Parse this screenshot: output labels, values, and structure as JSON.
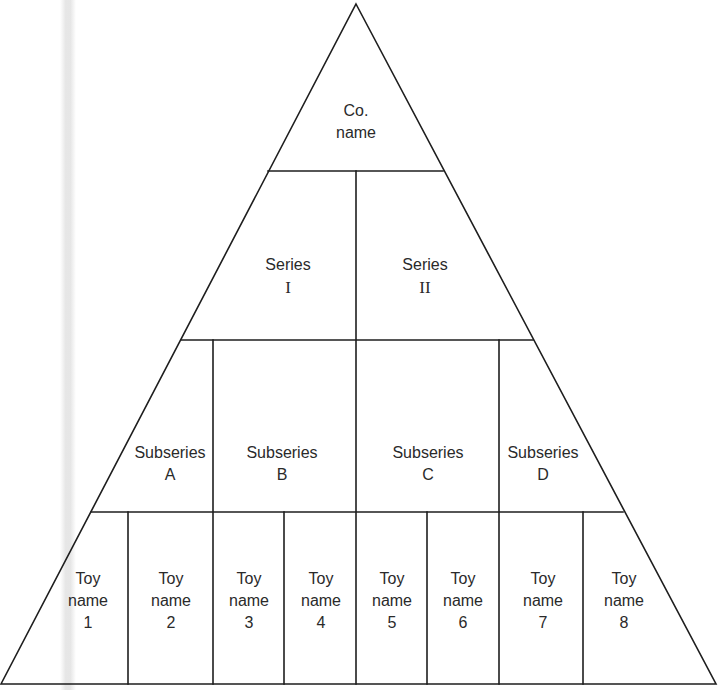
{
  "diagram": {
    "type": "hierarchy-pyramid",
    "levels": [
      {
        "name": "company",
        "nodes": [
          {
            "line1": "Co.",
            "line2": "name"
          }
        ]
      },
      {
        "name": "series",
        "nodes": [
          {
            "line1": "Series",
            "line2": "I"
          },
          {
            "line1": "Series",
            "line2": "II"
          }
        ]
      },
      {
        "name": "subseries",
        "nodes": [
          {
            "line1": "Subseries",
            "line2": "A"
          },
          {
            "line1": "Subseries",
            "line2": "B"
          },
          {
            "line1": "Subseries",
            "line2": "C"
          },
          {
            "line1": "Subseries",
            "line2": "D"
          }
        ]
      },
      {
        "name": "toys",
        "nodes": [
          {
            "line1": "Toy",
            "line2": "name",
            "line3": "1"
          },
          {
            "line1": "Toy",
            "line2": "name",
            "line3": "2"
          },
          {
            "line1": "Toy",
            "line2": "name",
            "line3": "3"
          },
          {
            "line1": "Toy",
            "line2": "name",
            "line3": "4"
          },
          {
            "line1": "Toy",
            "line2": "name",
            "line3": "5"
          },
          {
            "line1": "Toy",
            "line2": "name",
            "line3": "6"
          },
          {
            "line1": "Toy",
            "line2": "name",
            "line3": "7"
          },
          {
            "line1": "Toy",
            "line2": "name",
            "line3": "8"
          }
        ]
      }
    ],
    "colors": {
      "line": "#1e1e1e",
      "text": "#2a2a2a",
      "background": "#ffffff"
    }
  }
}
